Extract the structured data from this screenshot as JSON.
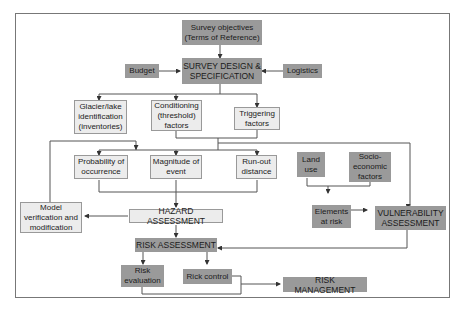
{
  "diagram": {
    "nodes": {
      "survey_objectives": "Survey objectives (Terms of Reference)",
      "budget": "Budget",
      "survey_design": "SURVEY DESIGN & SPECIFICATION",
      "logistics": "Logistics",
      "glacier_lake": "Glacier/lake identification (inventories)",
      "conditioning": "Conditioning (threshold) factors",
      "triggering": "Triggering factors",
      "probability": "Probability of occurrence",
      "magnitude": "Magnitude of event",
      "runout": "Run-out distance",
      "land_use": "Land use",
      "socio": "Socio-economic factors",
      "elements": "Elements at risk",
      "vulnerability": "VULNERABILITY ASSESSMENT",
      "model": "Model verification and modification",
      "hazard": "HAZARD ASSESSMENT",
      "risk_assessment": "RISK ASSESSMENT",
      "risk_evaluation": "Risk evaluation",
      "risk_control": "Rick control",
      "risk_management": "RISK MANAGEMENT"
    },
    "colors": {
      "dark": "#9a9a9a",
      "light": "#ececec",
      "line": "#444444"
    }
  }
}
